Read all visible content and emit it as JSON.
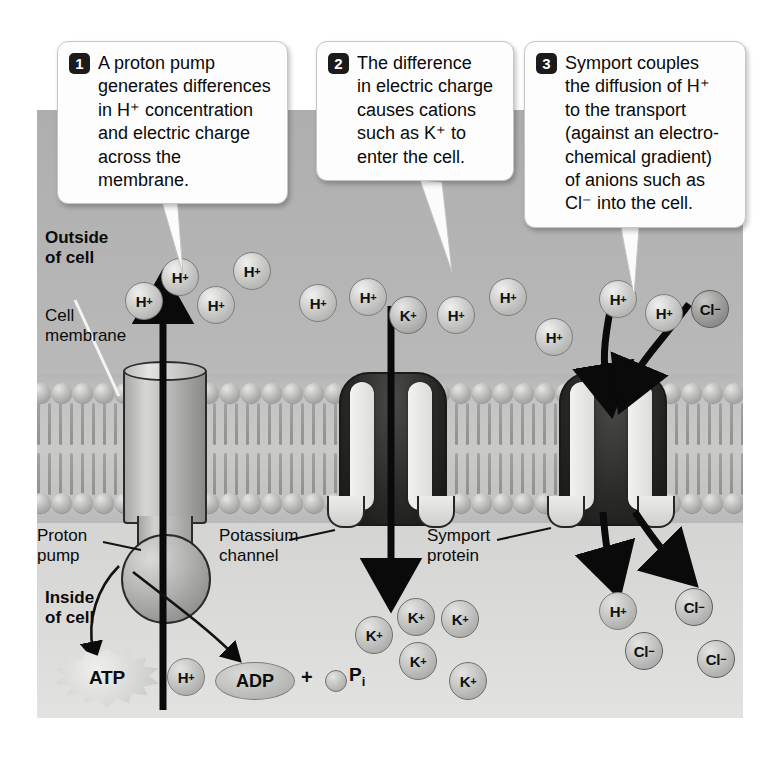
{
  "callouts": [
    {
      "number": "1",
      "text": "A proton pump\ngenerates differences\nin H⁺ concentration\nand electric charge\nacross the membrane."
    },
    {
      "number": "2",
      "text": "The difference\nin electric charge\ncauses cations\nsuch as K⁺ to\nenter the cell."
    },
    {
      "number": "3",
      "text": "Symport couples\nthe diffusion of H⁺\nto the transport\n(against an electro-\nchemical gradient)\nof anions such as\nCl⁻ into the cell."
    }
  ],
  "labels": {
    "outside": "Outside\nof cell",
    "cell_membrane": "Cell\nmembrane",
    "proton_pump": "Proton\npump",
    "potassium_channel": "Potassium\nchannel",
    "symport_protein": "Symport\nprotein",
    "inside": "Inside\nof cell"
  },
  "energy": {
    "atp": "ATP",
    "adp": "ADP",
    "plus": "+",
    "pi": "P",
    "pi_sub": "i"
  },
  "ions_outside": [
    {
      "species": "H",
      "charge": "+",
      "x": 88,
      "y": 172
    },
    {
      "species": "H",
      "charge": "+",
      "x": 124,
      "y": 148
    },
    {
      "species": "H",
      "charge": "+",
      "x": 160,
      "y": 176
    },
    {
      "species": "H",
      "charge": "+",
      "x": 196,
      "y": 142
    },
    {
      "species": "H",
      "charge": "+",
      "x": 262,
      "y": 174
    },
    {
      "species": "H",
      "charge": "+",
      "x": 312,
      "y": 168
    },
    {
      "species": "K",
      "charge": "+",
      "x": 352,
      "y": 186
    },
    {
      "species": "H",
      "charge": "+",
      "x": 400,
      "y": 186
    },
    {
      "species": "H",
      "charge": "+",
      "x": 452,
      "y": 168
    },
    {
      "species": "H",
      "charge": "+",
      "x": 498,
      "y": 208
    },
    {
      "species": "H",
      "charge": "+",
      "x": 562,
      "y": 170
    },
    {
      "species": "H",
      "charge": "+",
      "x": 608,
      "y": 184
    },
    {
      "species": "Cl",
      "charge": "−",
      "x": 654,
      "y": 180
    }
  ],
  "ions_inside": [
    {
      "species": "H",
      "charge": "+",
      "x": 130,
      "y": 548
    },
    {
      "species": "K",
      "charge": "+",
      "x": 318,
      "y": 506
    },
    {
      "species": "K",
      "charge": "+",
      "x": 360,
      "y": 488
    },
    {
      "species": "K",
      "charge": "+",
      "x": 404,
      "y": 490
    },
    {
      "species": "K",
      "charge": "+",
      "x": 362,
      "y": 532
    },
    {
      "species": "K",
      "charge": "+",
      "x": 412,
      "y": 552
    },
    {
      "species": "H",
      "charge": "+",
      "x": 562,
      "y": 482
    },
    {
      "species": "Cl",
      "charge": "−",
      "x": 638,
      "y": 478
    },
    {
      "species": "Cl",
      "charge": "−",
      "x": 588,
      "y": 522
    },
    {
      "species": "Cl",
      "charge": "−",
      "x": 660,
      "y": 530
    }
  ],
  "colors": {
    "outside_bg": "#b4b4b4",
    "inside_bg": "#dcdcda",
    "membrane": "#c9c9c7",
    "channel_dark": "#1a1a18",
    "callout_bg": "#fdfdfd",
    "badge_bg": "#1b1b1b",
    "arrow": "#0a0a0a"
  }
}
